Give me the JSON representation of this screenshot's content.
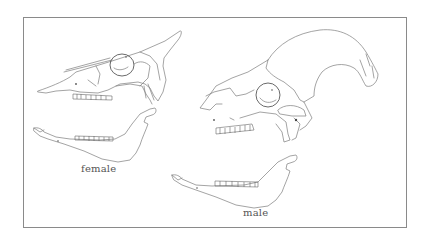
{
  "figure": {
    "specimens": [
      {
        "id": "female",
        "label": "female"
      },
      {
        "id": "male",
        "label": "male"
      }
    ],
    "colors": {
      "line": "#7d7d7d",
      "frame": "#8a8a8a",
      "label": "#555555",
      "background": "#ffffff"
    }
  }
}
